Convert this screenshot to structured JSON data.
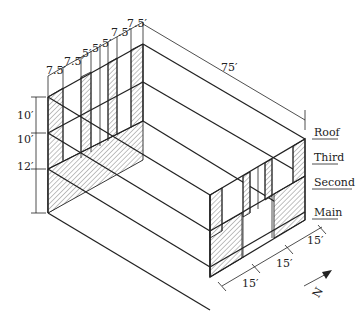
{
  "diagram": {
    "type": "isometric-building-frame",
    "top_dimensions": [
      "7.5′",
      "7.5′",
      "5′",
      "5′",
      "5′",
      "7.5′",
      "7.5′"
    ],
    "length_dimension": "75′",
    "story_heights": [
      "10′",
      "10′",
      "12′"
    ],
    "front_dimensions": [
      "15′",
      "15′",
      "15′"
    ],
    "floor_labels": [
      "Roof",
      "Third",
      "Second",
      "Main"
    ],
    "north_arrow_label": "N",
    "colors": {
      "line": "#222222",
      "background": "#ffffff",
      "hatch": "#555555"
    }
  }
}
